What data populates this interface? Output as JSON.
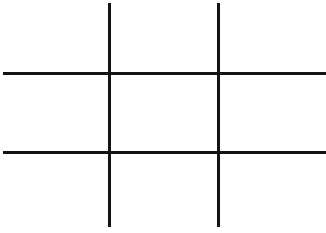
{
  "game": {
    "type": "tic-tac-toe",
    "grid_color": "#141414",
    "background_color": "#ffffff",
    "board": [
      [
        "",
        "",
        ""
      ],
      [
        "",
        "",
        ""
      ],
      [
        "",
        "",
        ""
      ]
    ]
  }
}
